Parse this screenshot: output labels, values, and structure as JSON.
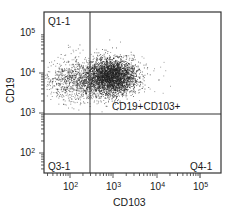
{
  "chart_data": {
    "type": "scatter",
    "title": "",
    "xlabel": "CD103",
    "ylabel": "CD19",
    "xscale": "log",
    "yscale": "log",
    "x_ticks": [
      "10^2",
      "10^3",
      "10^4",
      "10^5"
    ],
    "y_ticks": [
      "10^2",
      "10^3",
      "10^4",
      "10^5"
    ],
    "xlim": [
      10,
      200000
    ],
    "ylim": [
      10,
      200000
    ],
    "gates": {
      "vertical_x": 300,
      "horizontal_y": 1000
    },
    "quadrants": [
      {
        "name": "Q1-1",
        "position": "top-left"
      },
      {
        "name": "CD19+CD103+",
        "position": "top-right"
      },
      {
        "name": "Q3-1",
        "position": "bottom-left"
      },
      {
        "name": "Q4-1",
        "position": "bottom-right"
      }
    ],
    "population": {
      "description": "dense cluster spanning CD103 ~30 to ~3000, CD19 ~2000 to ~20000, densest near CD103 ~1000, CD19 ~6000",
      "center_x": 1000,
      "center_y": 6000
    },
    "grid": false,
    "legend": "none"
  },
  "labels": {
    "q1": "Q1-1",
    "q2": "CD19+CD103+",
    "q3": "Q3-1",
    "q4": "Q4-1",
    "xlabel": "CD103",
    "ylabel": "CD19",
    "x_tick_base": "10",
    "x_exp": [
      "2",
      "3",
      "4",
      "5"
    ],
    "y_exp": [
      "5",
      "4",
      "3",
      "2"
    ]
  }
}
